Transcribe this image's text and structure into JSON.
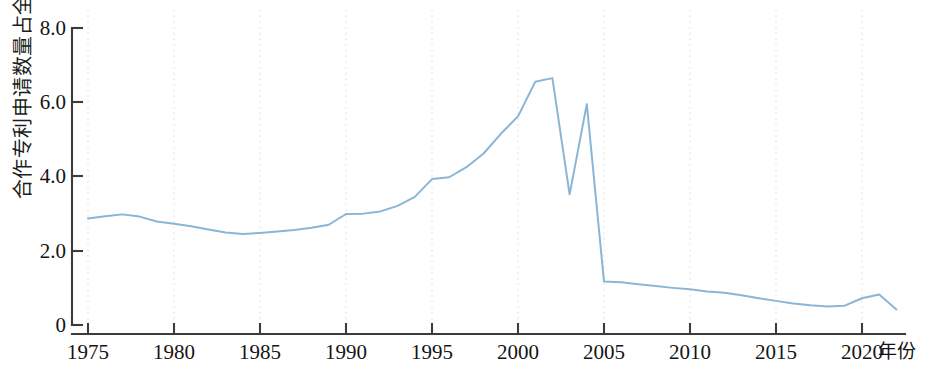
{
  "chart_data": {
    "type": "line",
    "title": "",
    "subtitle": "",
    "xlabel": "年份",
    "ylabel": "合作专利申请数量占全球比重（%）",
    "xlim": [
      1975,
      2022
    ],
    "ylim": [
      0,
      8.0
    ],
    "grid": "vertical dotted gridlines at 5-year x ticks",
    "legend": "none",
    "line_color": "#8ab6d6",
    "axis_color": "#3c3c3c",
    "gridline_color": "#e2e2e2",
    "x_ticks": [
      "1975",
      "1980",
      "1985",
      "1990",
      "1995",
      "2000",
      "2005",
      "2010",
      "2015",
      "2020"
    ],
    "x_tick_values": [
      1975,
      1980,
      1985,
      1990,
      1995,
      2000,
      2005,
      2010,
      2015,
      2020
    ],
    "y_ticks": [
      "0",
      "2.0",
      "4.0",
      "6.0",
      "8.0"
    ],
    "y_tick_values": [
      0,
      2.0,
      4.0,
      6.0,
      8.0
    ],
    "series": [
      {
        "name": "合作专利申请数量占全球比重",
        "x": [
          1975,
          1976,
          1977,
          1978,
          1979,
          1980,
          1981,
          1982,
          1983,
          1984,
          1985,
          1986,
          1987,
          1988,
          1989,
          1990,
          1991,
          1992,
          1993,
          1994,
          1995,
          1996,
          1997,
          1998,
          1999,
          2000,
          2001,
          2002,
          2003,
          2004,
          2005,
          2006,
          2007,
          2008,
          2009,
          2010,
          2011,
          2012,
          2013,
          2014,
          2015,
          2016,
          2017,
          2018,
          2019,
          2020,
          2021,
          2022
        ],
        "values": [
          2.87,
          2.93,
          2.98,
          2.92,
          2.79,
          2.73,
          2.66,
          2.57,
          2.49,
          2.45,
          2.48,
          2.52,
          2.56,
          2.62,
          2.7,
          2.99,
          3.0,
          3.06,
          3.21,
          3.45,
          3.93,
          3.98,
          4.25,
          4.62,
          5.15,
          5.62,
          6.55,
          6.65,
          3.52,
          5.95,
          1.17,
          1.15,
          1.1,
          1.05,
          1.0,
          0.96,
          0.9,
          0.87,
          0.8,
          0.72,
          0.65,
          0.58,
          0.53,
          0.5,
          0.52,
          0.72,
          0.82,
          0.42
        ]
      }
    ]
  },
  "axes": {
    "y_axis_label": "合作专利申请数量占全球比重（%）",
    "x_axis_label": "年份"
  }
}
